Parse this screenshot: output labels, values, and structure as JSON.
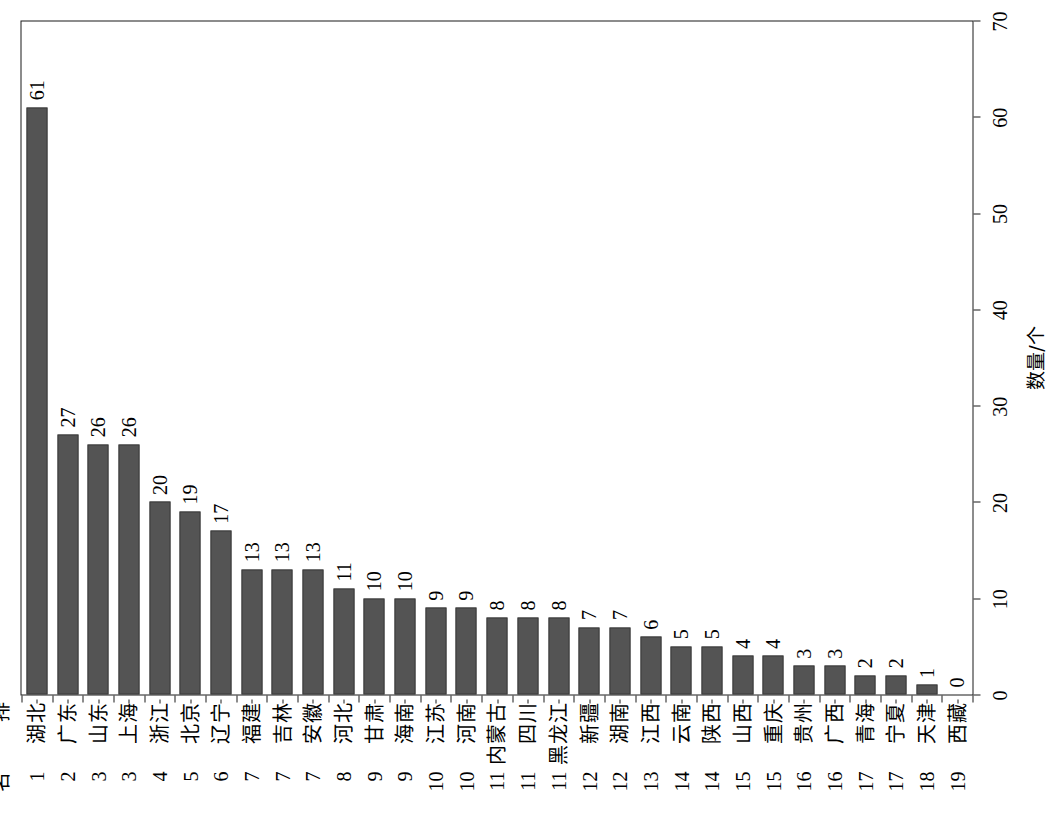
{
  "chart_data": {
    "type": "bar",
    "orientation": "vertical-rotated-90ccw",
    "title": "",
    "xlabel": "排 名",
    "ylabel": "数量/个",
    "ylim": [
      0,
      70
    ],
    "yticks": [
      0,
      10,
      20,
      30,
      40,
      50,
      60,
      70
    ],
    "ytick_labels": [
      "0",
      "10",
      "20",
      "30",
      "40",
      "50",
      "60",
      "70"
    ],
    "minor_tick_step": 2,
    "grid": false,
    "legend": null,
    "bar_color": "#545454",
    "axis_color": "#1a1a1a",
    "category_header_name": "排",
    "category_header_rank": "名",
    "categories": [
      "湖北",
      "广东",
      "山东",
      "上海",
      "浙江",
      "北京",
      "辽宁",
      "福建",
      "吉林",
      "安徽",
      "河北",
      "甘肃",
      "海南",
      "江苏",
      "河南",
      "内蒙古",
      "四川",
      "黑龙江",
      "新疆",
      "湖南",
      "江西",
      "云南",
      "陕西",
      "山西",
      "重庆",
      "贵州",
      "广西",
      "青海",
      "宁夏",
      "天津",
      "西藏"
    ],
    "ranks": [
      "1",
      "2",
      "3",
      "3",
      "4",
      "5",
      "6",
      "7",
      "7",
      "7",
      "8",
      "9",
      "9",
      "10",
      "10",
      "11",
      "11",
      "11",
      "12",
      "12",
      "13",
      "14",
      "14",
      "15",
      "15",
      "16",
      "16",
      "17",
      "17",
      "18",
      "19"
    ],
    "values": [
      61,
      27,
      26,
      26,
      20,
      19,
      17,
      13,
      13,
      13,
      11,
      10,
      10,
      9,
      9,
      8,
      8,
      8,
      7,
      7,
      6,
      5,
      5,
      4,
      4,
      3,
      3,
      2,
      2,
      1,
      0
    ],
    "value_labels": [
      "61",
      "27",
      "26",
      "26",
      "20",
      "19",
      "17",
      "13",
      "13",
      "13",
      "11",
      "10",
      "10",
      "9",
      "9",
      "8",
      "8",
      "8",
      "7",
      "7",
      "6",
      "5",
      "5",
      "4",
      "4",
      "3",
      "3",
      "2",
      "2",
      "1",
      "0"
    ]
  }
}
